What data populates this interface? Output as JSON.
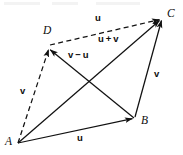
{
  "figure": {
    "type": "vector-parallelogram-diagram",
    "width": 183,
    "height": 155,
    "background": "#ffffff",
    "stroke_color": "#111111",
    "points": [
      {
        "id": "A",
        "label": "A",
        "x": 18,
        "y": 143,
        "label_x": 5,
        "label_y": 136
      },
      {
        "id": "B",
        "label": "B",
        "x": 134,
        "y": 118,
        "label_x": 141,
        "label_y": 115
      },
      {
        "id": "C",
        "label": "C",
        "x": 161,
        "y": 18,
        "label_x": 167,
        "label_y": 8
      },
      {
        "id": "D",
        "label": "D",
        "x": 48,
        "y": 48,
        "label_x": 43,
        "label_y": 25
      }
    ],
    "edges": [
      {
        "id": "AB",
        "from": "A",
        "to": "B",
        "style": "solid",
        "label": "u",
        "label_x": 77,
        "label_y": 133
      },
      {
        "id": "BC",
        "from": "B",
        "to": "C",
        "style": "solid",
        "label": "v",
        "label_x": 154,
        "label_y": 69
      },
      {
        "id": "AD",
        "from": "A",
        "to": "D",
        "style": "dashed",
        "label": "v",
        "label_x": 20,
        "label_y": 86
      },
      {
        "id": "DC",
        "from": "D",
        "to": "C",
        "style": "dashed",
        "label": "u",
        "label_x": 95,
        "label_y": 13
      },
      {
        "id": "AC",
        "from": "A",
        "to": "C",
        "style": "solid",
        "label": "u+v",
        "label_x": 98,
        "label_y": 34
      },
      {
        "id": "BD",
        "from": "B",
        "to": "D",
        "style": "solid",
        "label": "v-u",
        "label_x": 68,
        "label_y": 50
      }
    ],
    "labels": {
      "u_bottom": "u",
      "u_top": "u",
      "v_left": "v",
      "v_right": "v",
      "u_plus_v": "u + v",
      "v_minus_u": "v − u",
      "point_a": "A",
      "point_b": "B",
      "point_c": "C",
      "point_d": "D"
    }
  }
}
